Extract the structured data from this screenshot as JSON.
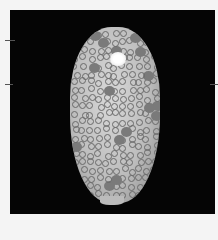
{
  "image": {
    "subject": "cowrie shell",
    "background_color": "#050505",
    "border_color": "#f4f4f4",
    "shell_colors": [
      "#d8d8d8",
      "#9a9a9a",
      "#6a6a6a"
    ],
    "highlight_color": "#ffffff"
  }
}
